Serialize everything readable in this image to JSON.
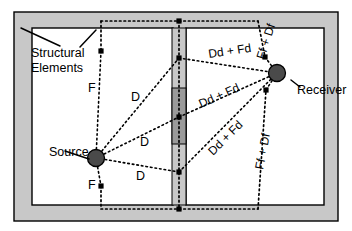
{
  "figure": {
    "type": "acoustic-flanking-transmission-diagram",
    "background_color": "#ffffff",
    "wall_fill": "#c8c8c8",
    "partition_core_fill": "#9a9a9a",
    "marker_fill": "#4a4a4a",
    "line_color": "#000000"
  },
  "annotations": {
    "structural_elements": "Structural\nElements",
    "structural_elements_line1": "Structural",
    "structural_elements_line2": "Elements",
    "source": "Source",
    "receiver": "Receiver"
  },
  "path_labels": {
    "flanking_left_top": "F",
    "flanking_left_bottom": "F",
    "direct_upper": "D",
    "direct_middle": "D",
    "direct_lower": "D",
    "dd_fd_upper": "Dd + Fd",
    "dd_fd_middle": "Dd + Fd",
    "dd_fd_lower": "Dd + Fd",
    "ff_df_top": "Ff + Df",
    "ff_df_bottom": "Ff + Df"
  },
  "transmission_paths": [
    {
      "id": "Dd",
      "name": "direct-direct",
      "label": "D",
      "side": "source"
    },
    {
      "id": "Df",
      "name": "direct-flanking",
      "label": "D",
      "side": "source"
    },
    {
      "id": "Fd",
      "name": "flanking-direct",
      "label": "F",
      "side": "source"
    },
    {
      "id": "Ff",
      "name": "flanking-flanking",
      "label": "F",
      "side": "source"
    },
    {
      "id": "Dd + Fd",
      "name": "receiver-side-upper",
      "label": "Dd + Fd",
      "side": "receiver"
    },
    {
      "id": "Dd + Fd",
      "name": "receiver-side-middle",
      "label": "Dd + Fd",
      "side": "receiver"
    },
    {
      "id": "Dd + Fd",
      "name": "receiver-side-lower",
      "label": "Dd + Fd",
      "side": "receiver"
    },
    {
      "id": "Ff + Df",
      "name": "flanking-top",
      "label": "Ff + Df",
      "side": "receiver"
    },
    {
      "id": "Ff + Df",
      "name": "flanking-bottom",
      "label": "Ff + Df",
      "side": "receiver"
    }
  ],
  "nodes": [
    {
      "name": "source-marker",
      "x": 96,
      "y": 158,
      "r": 8
    },
    {
      "name": "receiver-marker",
      "x": 277,
      "y": 73,
      "r": 8
    },
    {
      "name": "junction-partition-top",
      "x": 179,
      "y": 21,
      "r": 2.6
    },
    {
      "name": "junction-partition-bottom",
      "x": 179,
      "y": 209,
      "r": 2.6
    },
    {
      "name": "junction-partition-upper",
      "x": 179,
      "y": 58,
      "r": 2.6
    },
    {
      "name": "junction-partition-middle",
      "x": 179,
      "y": 117,
      "r": 2.6
    },
    {
      "name": "junction-partition-lower",
      "x": 179,
      "y": 172,
      "r": 2.6
    }
  ]
}
